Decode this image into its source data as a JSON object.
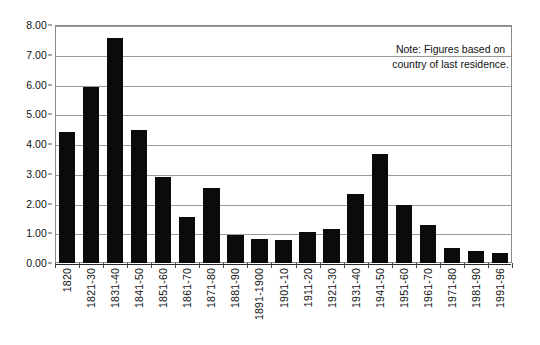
{
  "chart_data": {
    "type": "bar",
    "title": "",
    "subtitle": "",
    "xlabel": "",
    "ylabel": "",
    "ylim": [
      0,
      8
    ],
    "ytick_step": 1,
    "ytick_labels": [
      "0.00",
      "1.00",
      "2.00",
      "3.00",
      "4.00",
      "5.00",
      "6.00",
      "7.00",
      "8.00"
    ],
    "grid": true,
    "legend": "none",
    "bar_color": "#0b0b0b",
    "categories": [
      "1820",
      "1821-30",
      "1831-40",
      "1841-50",
      "1851-60",
      "1861-70",
      "1871-80",
      "1881-90",
      "1891-1900",
      "1901-10",
      "1911-20",
      "1921-30",
      "1931-40",
      "1941-50",
      "1951-60",
      "1961-70",
      "1971-80",
      "1981-90",
      "1991-96"
    ],
    "values": [
      4.42,
      5.93,
      7.57,
      4.47,
      2.89,
      1.55,
      2.53,
      0.95,
      0.81,
      0.79,
      1.04,
      1.14,
      2.33,
      3.68,
      1.95,
      1.29,
      0.49,
      0.4,
      0.33
    ],
    "annotations": [
      {
        "name": "note",
        "lines": [
          "Note: Figures based on",
          "country of last residence."
        ]
      }
    ]
  }
}
